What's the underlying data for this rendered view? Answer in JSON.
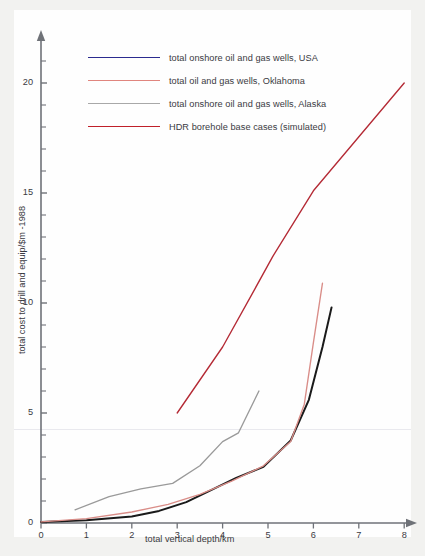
{
  "figure": {
    "background_color": "#f2f2f0",
    "canvas_color": "#fefefe"
  },
  "axes": {
    "y_axis_label": "total cost to drill and equip/$m -1988",
    "x_axis_label": "total vertical depth/km",
    "y_ticks_major": [
      "0",
      "5",
      "10",
      "15",
      "20"
    ],
    "x_ticks": [
      "0",
      "1",
      "2",
      "3",
      "4",
      "5",
      "6",
      "7",
      "8"
    ]
  },
  "legend": {
    "items": [
      {
        "label": "total onshore oil and gas wells, USA",
        "color": "#2b2b8f"
      },
      {
        "label": "total oil and gas wells, Oklahoma",
        "color": "#e0857e"
      },
      {
        "label": "total onshore oil and gas wells, Alaska",
        "color": "#a8a8a8"
      },
      {
        "label": "HDR borehole base cases (simulated)",
        "color": "#c0202a"
      }
    ]
  },
  "chart_data": {
    "type": "line",
    "title": "",
    "xlabel": "total vertical depth/km",
    "ylabel": "total cost to drill and equip/$m -1988",
    "xlim": [
      0,
      8
    ],
    "ylim": [
      0,
      21.5
    ],
    "x_major_ticks": [
      0,
      1,
      2,
      3,
      4,
      5,
      6,
      7,
      8
    ],
    "y_major_ticks": [
      0,
      5,
      10,
      15,
      20
    ],
    "y_minor_tick_step": 1,
    "grid": false,
    "legend_position": "upper-left-inside",
    "series": [
      {
        "name": "total onshore oil and gas wells, USA",
        "color": "#1a1a1a",
        "legend_color": "#2b2b8f",
        "points": [
          [
            0.0,
            0.05
          ],
          [
            1.0,
            0.12
          ],
          [
            2.0,
            0.3
          ],
          [
            2.6,
            0.55
          ],
          [
            3.2,
            0.95
          ],
          [
            3.7,
            1.45
          ],
          [
            4.3,
            2.05
          ],
          [
            4.9,
            2.55
          ],
          [
            5.5,
            3.75
          ],
          [
            5.9,
            5.6
          ],
          [
            6.2,
            8.0
          ],
          [
            6.4,
            9.8
          ]
        ]
      },
      {
        "name": "total oil and gas wells, Oklahoma",
        "color": "#d98d88",
        "legend_color": "#e0857e",
        "points": [
          [
            0.0,
            0.05
          ],
          [
            1.0,
            0.2
          ],
          [
            2.0,
            0.5
          ],
          [
            2.8,
            0.85
          ],
          [
            3.5,
            1.3
          ],
          [
            4.2,
            1.9
          ],
          [
            4.9,
            2.6
          ],
          [
            5.5,
            3.7
          ],
          [
            5.8,
            5.4
          ],
          [
            6.0,
            8.2
          ],
          [
            6.2,
            10.9
          ]
        ]
      },
      {
        "name": "total onshore oil and gas wells, Alaska",
        "color": "#9a9a9a",
        "legend_color": "#a8a8a8",
        "points": [
          [
            0.75,
            0.6
          ],
          [
            1.5,
            1.2
          ],
          [
            2.2,
            1.55
          ],
          [
            2.9,
            1.8
          ],
          [
            3.5,
            2.6
          ],
          [
            4.0,
            3.7
          ],
          [
            4.35,
            4.1
          ],
          [
            4.8,
            6.0
          ]
        ]
      },
      {
        "name": "HDR borehole base cases (simulated)",
        "color": "#b42a35",
        "legend_color": "#c0202a",
        "points": [
          [
            3.0,
            5.0
          ],
          [
            4.0,
            8.0
          ],
          [
            4.7,
            10.6
          ],
          [
            5.1,
            12.1
          ],
          [
            6.0,
            15.1
          ],
          [
            8.0,
            20.0
          ]
        ]
      }
    ]
  }
}
